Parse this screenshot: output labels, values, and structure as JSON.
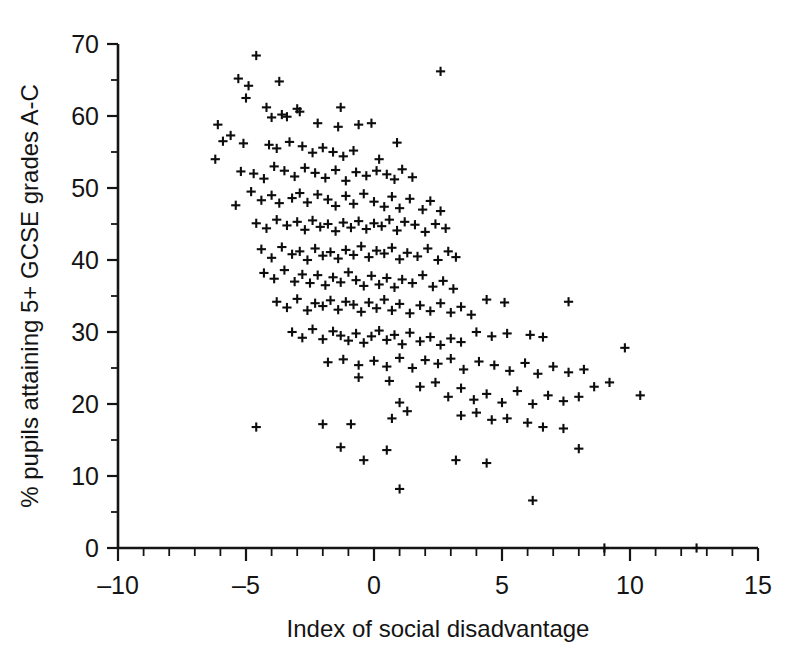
{
  "chart_data": {
    "type": "scatter",
    "title": "",
    "xlabel": "Index of social disadvantage",
    "ylabel": "% pupils attaining 5+ GCSE grades A-C",
    "xlim": [
      -10,
      15
    ],
    "ylim": [
      0,
      70
    ],
    "xticks": [
      -10,
      -5,
      0,
      5,
      10,
      15
    ],
    "xtick_labels": [
      "–10",
      "–5",
      "0",
      "5",
      "10",
      "15"
    ],
    "yticks": [
      0,
      10,
      20,
      30,
      40,
      50,
      60,
      70
    ],
    "ytick_labels": [
      "0",
      "10",
      "20",
      "30",
      "40",
      "50",
      "60",
      "70"
    ],
    "x_minor_tick_step": 1,
    "y_minor_tick_step": 5,
    "grid": false,
    "legend": null,
    "marker": "plus",
    "marker_color": "#0d0d0d",
    "n_points": 252,
    "points": [
      [
        -4.6,
        68.4
      ],
      [
        -5.3,
        65.2
      ],
      [
        -4.9,
        64.2
      ],
      [
        -3.7,
        64.8
      ],
      [
        2.6,
        66.2
      ],
      [
        -5.0,
        62.5
      ],
      [
        -4.2,
        61.2
      ],
      [
        -3.0,
        61.0
      ],
      [
        -1.3,
        61.2
      ],
      [
        -6.1,
        58.8
      ],
      [
        -6.2,
        54.0
      ],
      [
        -5.6,
        57.3
      ],
      [
        -5.9,
        56.5
      ],
      [
        -4.0,
        59.8
      ],
      [
        -3.6,
        60.2
      ],
      [
        -3.4,
        59.9
      ],
      [
        -2.9,
        60.6
      ],
      [
        -2.2,
        59.0
      ],
      [
        -1.4,
        58.5
      ],
      [
        -0.6,
        58.8
      ],
      [
        -0.1,
        59.0
      ],
      [
        -5.1,
        56.2
      ],
      [
        -4.1,
        56.0
      ],
      [
        -3.8,
        55.5
      ],
      [
        -3.3,
        56.4
      ],
      [
        -2.8,
        55.8
      ],
      [
        -2.4,
        54.9
      ],
      [
        -2.0,
        55.6
      ],
      [
        -1.6,
        55.0
      ],
      [
        -1.2,
        54.4
      ],
      [
        -0.8,
        55.2
      ],
      [
        0.2,
        54.0
      ],
      [
        0.9,
        56.3
      ],
      [
        -5.2,
        52.3
      ],
      [
        -4.7,
        52.0
      ],
      [
        -4.3,
        51.3
      ],
      [
        -3.9,
        53.0
      ],
      [
        -3.5,
        52.4
      ],
      [
        -3.1,
        51.6
      ],
      [
        -2.7,
        52.8
      ],
      [
        -2.3,
        52.1
      ],
      [
        -1.9,
        51.4
      ],
      [
        -1.5,
        52.5
      ],
      [
        -1.1,
        51.0
      ],
      [
        -0.7,
        52.2
      ],
      [
        -0.3,
        51.7
      ],
      [
        0.1,
        52.4
      ],
      [
        0.5,
        51.9
      ],
      [
        0.8,
        51.2
      ],
      [
        1.1,
        52.6
      ],
      [
        1.5,
        51.5
      ],
      [
        -5.4,
        47.6
      ],
      [
        -4.8,
        49.5
      ],
      [
        -4.4,
        48.3
      ],
      [
        -4.0,
        49.0
      ],
      [
        -3.7,
        47.9
      ],
      [
        -3.2,
        48.6
      ],
      [
        -2.9,
        49.3
      ],
      [
        -2.6,
        48.0
      ],
      [
        -2.2,
        49.1
      ],
      [
        -1.8,
        48.4
      ],
      [
        -1.5,
        47.5
      ],
      [
        -1.1,
        48.9
      ],
      [
        -0.8,
        47.8
      ],
      [
        -0.4,
        49.2
      ],
      [
        0.0,
        48.1
      ],
      [
        0.4,
        47.4
      ],
      [
        0.7,
        48.8
      ],
      [
        1.0,
        47.2
      ],
      [
        1.4,
        48.5
      ],
      [
        1.9,
        47.0
      ],
      [
        2.2,
        48.2
      ],
      [
        2.6,
        46.8
      ],
      [
        -4.6,
        45.1
      ],
      [
        -4.2,
        44.4
      ],
      [
        -3.8,
        45.6
      ],
      [
        -3.4,
        44.8
      ],
      [
        -3.0,
        45.3
      ],
      [
        -2.7,
        44.2
      ],
      [
        -2.4,
        45.5
      ],
      [
        -2.1,
        44.6
      ],
      [
        -1.8,
        45.0
      ],
      [
        -1.5,
        44.0
      ],
      [
        -1.2,
        45.2
      ],
      [
        -0.9,
        44.5
      ],
      [
        -0.6,
        45.4
      ],
      [
        -0.3,
        44.3
      ],
      [
        0.0,
        45.1
      ],
      [
        0.3,
        44.7
      ],
      [
        0.6,
        45.6
      ],
      [
        0.9,
        44.1
      ],
      [
        1.2,
        45.3
      ],
      [
        1.6,
        44.9
      ],
      [
        2.0,
        43.9
      ],
      [
        2.4,
        45.0
      ],
      [
        2.8,
        44.4
      ],
      [
        -4.4,
        41.5
      ],
      [
        -4.0,
        40.3
      ],
      [
        -3.6,
        41.8
      ],
      [
        -3.2,
        40.8
      ],
      [
        -2.9,
        41.2
      ],
      [
        -2.6,
        40.0
      ],
      [
        -2.3,
        41.6
      ],
      [
        -2.0,
        40.6
      ],
      [
        -1.7,
        41.1
      ],
      [
        -1.4,
        40.2
      ],
      [
        -1.1,
        41.4
      ],
      [
        -0.8,
        40.7
      ],
      [
        -0.5,
        41.9
      ],
      [
        -0.2,
        40.4
      ],
      [
        0.1,
        41.3
      ],
      [
        0.4,
        40.9
      ],
      [
        0.7,
        41.7
      ],
      [
        1.0,
        40.1
      ],
      [
        1.3,
        41.0
      ],
      [
        1.7,
        40.5
      ],
      [
        2.1,
        41.6
      ],
      [
        2.5,
        40.0
      ],
      [
        2.9,
        41.2
      ],
      [
        3.2,
        40.4
      ],
      [
        -4.3,
        38.2
      ],
      [
        -3.9,
        37.4
      ],
      [
        -3.5,
        38.6
      ],
      [
        -3.1,
        37.0
      ],
      [
        -2.8,
        38.0
      ],
      [
        -2.5,
        36.8
      ],
      [
        -2.2,
        37.9
      ],
      [
        -1.9,
        36.5
      ],
      [
        -1.6,
        37.6
      ],
      [
        -1.3,
        36.9
      ],
      [
        -1.0,
        38.3
      ],
      [
        -0.7,
        37.2
      ],
      [
        -0.4,
        36.4
      ],
      [
        -0.1,
        37.8
      ],
      [
        0.2,
        36.6
      ],
      [
        0.5,
        37.5
      ],
      [
        0.8,
        36.2
      ],
      [
        1.1,
        37.3
      ],
      [
        1.5,
        36.8
      ],
      [
        1.9,
        37.9
      ],
      [
        2.3,
        36.3
      ],
      [
        2.7,
        37.1
      ],
      [
        3.1,
        36.0
      ],
      [
        -3.8,
        34.2
      ],
      [
        -3.4,
        33.4
      ],
      [
        -3.0,
        34.6
      ],
      [
        -2.6,
        33.0
      ],
      [
        -2.3,
        34.0
      ],
      [
        -2.0,
        33.6
      ],
      [
        -1.7,
        34.4
      ],
      [
        -1.4,
        33.1
      ],
      [
        -1.1,
        34.2
      ],
      [
        -0.8,
        33.8
      ],
      [
        -0.5,
        32.8
      ],
      [
        -0.2,
        34.1
      ],
      [
        0.1,
        33.3
      ],
      [
        0.4,
        34.5
      ],
      [
        0.7,
        33.0
      ],
      [
        1.0,
        33.9
      ],
      [
        1.4,
        32.6
      ],
      [
        1.8,
        33.7
      ],
      [
        2.2,
        32.9
      ],
      [
        2.6,
        34.0
      ],
      [
        3.0,
        32.7
      ],
      [
        3.4,
        33.5
      ],
      [
        3.8,
        32.4
      ],
      [
        4.4,
        34.5
      ],
      [
        5.1,
        34.1
      ],
      [
        7.6,
        34.2
      ],
      [
        -3.2,
        30.0
      ],
      [
        -2.8,
        29.2
      ],
      [
        -2.4,
        30.4
      ],
      [
        -2.0,
        29.0
      ],
      [
        -1.6,
        30.1
      ],
      [
        -1.3,
        29.5
      ],
      [
        -1.0,
        28.8
      ],
      [
        -0.7,
        29.8
      ],
      [
        -0.4,
        28.5
      ],
      [
        -0.1,
        29.4
      ],
      [
        0.2,
        30.2
      ],
      [
        0.5,
        28.9
      ],
      [
        0.8,
        29.6
      ],
      [
        1.1,
        28.3
      ],
      [
        1.4,
        29.9
      ],
      [
        1.8,
        28.7
      ],
      [
        2.2,
        29.3
      ],
      [
        2.6,
        28.2
      ],
      [
        3.0,
        29.1
      ],
      [
        3.4,
        28.6
      ],
      [
        4.0,
        30.0
      ],
      [
        4.6,
        29.4
      ],
      [
        5.2,
        29.8
      ],
      [
        6.1,
        29.6
      ],
      [
        6.6,
        29.3
      ],
      [
        -1.8,
        25.8
      ],
      [
        -1.2,
        26.2
      ],
      [
        -0.6,
        25.4
      ],
      [
        0.0,
        26.0
      ],
      [
        0.5,
        25.2
      ],
      [
        1.0,
        26.4
      ],
      [
        1.5,
        25.0
      ],
      [
        2.0,
        26.1
      ],
      [
        2.5,
        25.6
      ],
      [
        3.0,
        26.3
      ],
      [
        3.5,
        24.8
      ],
      [
        4.1,
        25.9
      ],
      [
        4.7,
        25.4
      ],
      [
        5.3,
        24.6
      ],
      [
        5.9,
        25.7
      ],
      [
        6.4,
        24.2
      ],
      [
        7.0,
        25.2
      ],
      [
        7.6,
        24.4
      ],
      [
        8.2,
        24.8
      ],
      [
        9.8,
        27.8
      ],
      [
        10.4,
        21.2
      ],
      [
        -0.6,
        23.7
      ],
      [
        0.6,
        23.2
      ],
      [
        1.8,
        22.4
      ],
      [
        2.4,
        23.0
      ],
      [
        2.9,
        21.0
      ],
      [
        3.4,
        22.2
      ],
      [
        3.9,
        20.6
      ],
      [
        4.4,
        21.4
      ],
      [
        5.0,
        20.2
      ],
      [
        5.6,
        21.8
      ],
      [
        6.2,
        20.0
      ],
      [
        6.8,
        21.2
      ],
      [
        7.4,
        20.4
      ],
      [
        8.0,
        21.0
      ],
      [
        8.6,
        22.4
      ],
      [
        9.2,
        23.0
      ],
      [
        1.0,
        20.2
      ],
      [
        0.7,
        18.0
      ],
      [
        1.3,
        19.0
      ],
      [
        3.4,
        18.4
      ],
      [
        4.0,
        18.8
      ],
      [
        4.6,
        17.8
      ],
      [
        5.2,
        18.0
      ],
      [
        6.0,
        17.4
      ],
      [
        6.6,
        16.8
      ],
      [
        7.4,
        16.6
      ],
      [
        8.0,
        13.8
      ],
      [
        -4.6,
        16.8
      ],
      [
        -2.0,
        17.2
      ],
      [
        -0.9,
        17.2
      ],
      [
        -1.3,
        14.0
      ],
      [
        0.5,
        13.6
      ],
      [
        -0.4,
        12.2
      ],
      [
        3.2,
        12.2
      ],
      [
        4.4,
        11.8
      ],
      [
        1.0,
        8.2
      ],
      [
        6.2,
        6.6
      ],
      [
        9.0,
        0.0
      ],
      [
        12.6,
        0.0
      ]
    ]
  },
  "axes": {
    "y_axis_name": "y-axis",
    "x_axis_name": "x-axis"
  }
}
